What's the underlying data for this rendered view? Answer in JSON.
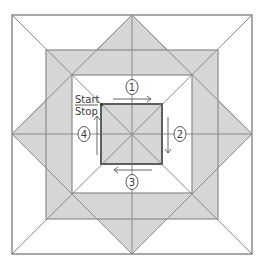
{
  "diagram": {
    "type": "quilt-block-sewing-order",
    "colors": {
      "line": "#8a8a8a",
      "line_dark": "#555555",
      "shade": "#d6d6d6",
      "background": "#ffffff",
      "text": "#3a3a3a"
    },
    "start_label": "Start",
    "stop_label": "Stop",
    "steps": [
      {
        "number": "1",
        "direction": "right"
      },
      {
        "number": "2",
        "direction": "down"
      },
      {
        "number": "3",
        "direction": "left"
      },
      {
        "number": "4",
        "direction": "up"
      }
    ]
  }
}
